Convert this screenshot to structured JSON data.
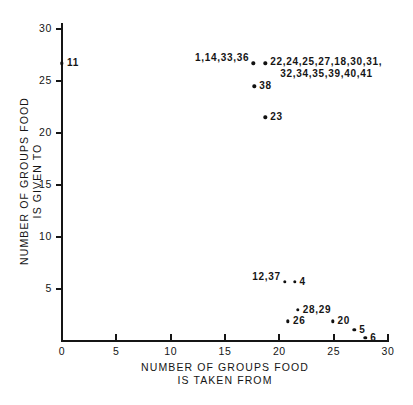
{
  "chart_data": {
    "type": "scatter",
    "title": "",
    "xlabel": "NUMBER OF GROUPS FOOD IS TAKEN FROM",
    "ylabel": "NUMBER OF GROUPS FOOD IS GIVEN TO",
    "xlabel_lines": [
      "NUMBER OF GROUPS FOOD",
      "IS TAKEN FROM"
    ],
    "ylabel_lines": [
      "NUMBER OF GROUPS FOOD",
      "IS GIVEN TO"
    ],
    "xlim": [
      0,
      30
    ],
    "ylim": [
      0,
      30
    ],
    "xticks": [
      0,
      5,
      10,
      15,
      20,
      25,
      30
    ],
    "yticks": [
      5,
      10,
      15,
      20,
      25,
      30
    ],
    "xtick_labels": [
      "0",
      "5",
      "10",
      "15",
      "20",
      "25",
      "30"
    ],
    "ytick_labels": [
      "5",
      "10",
      "15",
      "20",
      "25",
      "30"
    ],
    "grid": false,
    "legend": false,
    "marker_color": "#111111",
    "axis_color": "#151515",
    "background": "#ffffff",
    "points": [
      {
        "label": "11",
        "x": 0.0,
        "y": 26.7,
        "label_side": "right"
      },
      {
        "label": "1,14,33,36",
        "x": 17.6,
        "y": 26.7,
        "label_side": "left"
      },
      {
        "label": "22,24,25,27,18,30,31,",
        "label_line2": "32,34,35,39,40,41",
        "x": 18.7,
        "y": 26.7,
        "label_side": "right"
      },
      {
        "label": "38",
        "x": 17.7,
        "y": 24.5,
        "label_side": "right"
      },
      {
        "label": "23",
        "x": 18.7,
        "y": 21.5,
        "label_side": "right"
      },
      {
        "label": "12,37",
        "x": 20.5,
        "y": 5.7,
        "label_side": "left"
      },
      {
        "label": "4",
        "x": 21.4,
        "y": 5.7,
        "label_side": "right"
      },
      {
        "label": "28,29",
        "x": 21.7,
        "y": 3.0,
        "label_side": "right"
      },
      {
        "label": "26",
        "x": 20.8,
        "y": 1.9,
        "label_side": "right"
      },
      {
        "label": "20",
        "x": 24.9,
        "y": 1.9,
        "label_side": "right"
      },
      {
        "label": "5",
        "x": 26.9,
        "y": 1.1,
        "label_side": "right"
      },
      {
        "label": "6",
        "x": 27.9,
        "y": 0.3,
        "label_side": "right"
      }
    ]
  }
}
